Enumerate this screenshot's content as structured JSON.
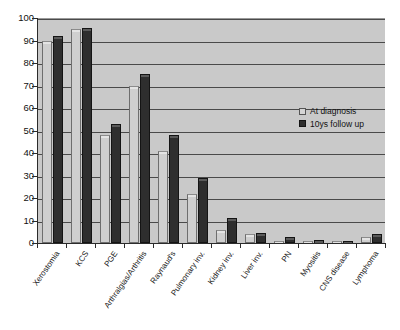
{
  "chart_data": {
    "type": "bar",
    "title": "",
    "subtitle": "",
    "xlabel": "",
    "ylabel": "",
    "ylim": [
      0,
      100
    ],
    "ytick_step": 10,
    "yticks": [
      0,
      10,
      20,
      30,
      40,
      50,
      60,
      70,
      80,
      90,
      100
    ],
    "grid": true,
    "legend_position": "inside-right",
    "categories": [
      "Xerostomia",
      "KCS",
      "PGE",
      "Arthralgias/Arthritis",
      "Raynaud's",
      "Pulmonary inv.",
      "Kidney inv.",
      "Liver inv.",
      "PN",
      "Myositis",
      "CNS disease",
      "Lymphoma"
    ],
    "series": [
      {
        "name": "At diagnosis",
        "color": "#cfcfcf",
        "values": [
          90,
          95,
          48,
          70,
          41,
          22,
          6,
          4,
          1,
          1,
          0.3,
          2.5
        ]
      },
      {
        "name": "10ys follow up",
        "color": "#2e2e2e",
        "values": [
          92,
          95.5,
          53,
          75,
          48,
          29,
          11,
          4.5,
          2.5,
          1.5,
          0.5,
          4
        ]
      }
    ]
  },
  "legend": {
    "items": [
      {
        "label": "At diagnosis",
        "swatch": "light"
      },
      {
        "label": "10ys follow up",
        "swatch": "dark"
      }
    ]
  },
  "axis": {
    "y_tick_labels": [
      "100",
      "90",
      "80",
      "70",
      "60",
      "50",
      "40",
      "30",
      "20",
      "10",
      "0"
    ]
  },
  "colors": {
    "plot_background": "#c9c9c9",
    "gridline": "#4a4a4a",
    "axis": "#2b2b2b",
    "series_light": "#cfcfcf",
    "series_dark": "#2e2e2e",
    "page_background": "#ffffff"
  }
}
